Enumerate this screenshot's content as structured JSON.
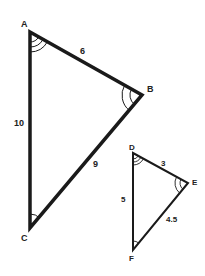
{
  "diagram": {
    "type": "similar-triangles",
    "colors": {
      "stroke": "#1a1a1a",
      "background": "#ffffff",
      "text": "#222222"
    },
    "triangles": [
      {
        "name": "ABC",
        "vertices": {
          "A": {
            "label": "A",
            "x": 30,
            "y": 32,
            "angle_marks": 3
          },
          "B": {
            "label": "B",
            "x": 142,
            "y": 95,
            "angle_marks": 2
          },
          "C": {
            "label": "C",
            "x": 30,
            "y": 228,
            "angle_marks": 1
          }
        },
        "sides": {
          "AB": {
            "label": "6"
          },
          "AC": {
            "label": "10"
          },
          "BC": {
            "label": "9"
          }
        }
      },
      {
        "name": "DEF",
        "vertices": {
          "D": {
            "label": "D",
            "x": 133,
            "y": 153,
            "angle_marks": 3
          },
          "E": {
            "label": "E",
            "x": 188,
            "y": 183,
            "angle_marks": 2
          },
          "F": {
            "label": "F",
            "x": 133,
            "y": 250,
            "angle_marks": 1
          }
        },
        "sides": {
          "DE": {
            "label": "3"
          },
          "DF": {
            "label": "5"
          },
          "EF": {
            "label": "4.5"
          }
        }
      }
    ]
  }
}
